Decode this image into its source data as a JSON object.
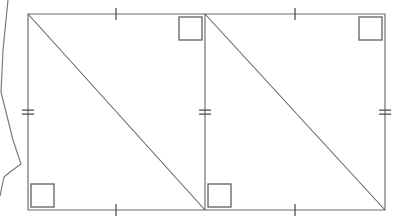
{
  "figure": {
    "type": "geometry-diagram",
    "canvas": {
      "width": 405,
      "height": 221
    },
    "background_color": "#ffffff",
    "stroke_color": "#6b6b6b",
    "marker_color": "#595959",
    "tick_color": "#4a4a4a"
  },
  "outline": {
    "name": "outer-rectangle",
    "left": 28,
    "top": 14,
    "right": 385,
    "bottom": 210,
    "width": 357,
    "height": 196,
    "path": "M 28 14 L 385 14 L 385 210 L 28 210 Z"
  },
  "divider": {
    "name": "middle-vertical-divider",
    "x": 205,
    "y_top": 14,
    "y_bottom": 210,
    "path": "M 205 14 L 205 210"
  },
  "diagonals": [
    {
      "name": "left-diagonal",
      "from": {
        "x": 28,
        "y": 14
      },
      "to": {
        "x": 205,
        "y": 210
      },
      "path": "M 28 14 L 205 210"
    },
    {
      "name": "right-diagonal",
      "from": {
        "x": 205,
        "y": 14
      },
      "to": {
        "x": 385,
        "y": 210
      },
      "path": "M 205 14 L 385 210"
    }
  ],
  "right_angle_markers": [
    {
      "name": "right-angle-bottom-left",
      "x": 31,
      "y": 184,
      "size": 23,
      "corner": "bottom-left"
    },
    {
      "name": "right-angle-top-middle",
      "x": 179,
      "y": 17,
      "size": 23,
      "corner": "top-middle-left-of-divider"
    },
    {
      "name": "right-angle-bottom-middle",
      "x": 208,
      "y": 184,
      "size": 23,
      "corner": "bottom-middle-right-of-divider"
    },
    {
      "name": "right-angle-top-right",
      "x": 359,
      "y": 17,
      "size": 23,
      "corner": "top-right"
    }
  ],
  "single_ticks": [
    {
      "name": "tick-top-left-segment",
      "x": 116,
      "y": 14,
      "orientation": "vertical"
    },
    {
      "name": "tick-top-right-segment",
      "x": 295,
      "y": 14,
      "orientation": "vertical"
    },
    {
      "name": "tick-bottom-left-segment",
      "x": 116,
      "y": 210,
      "orientation": "vertical"
    },
    {
      "name": "tick-bottom-right-segment",
      "x": 295,
      "y": 210,
      "orientation": "vertical"
    }
  ],
  "double_ticks": [
    {
      "name": "double-tick-left-side",
      "x": 28,
      "y": 112,
      "orientation": "horizontal"
    },
    {
      "name": "double-tick-middle-divider",
      "x": 205,
      "y": 112,
      "orientation": "horizontal"
    },
    {
      "name": "double-tick-right-side",
      "x": 385,
      "y": 112,
      "orientation": "horizontal"
    }
  ],
  "tick_style": {
    "single_half_length": 6,
    "double_half_length": 6,
    "double_gap": 4
  },
  "clipped_fragment": {
    "name": "clipped-polygon-fragment-left-edge",
    "description": "partial outline of an adjacent figure cut off by the left image border",
    "path": "M 8 0 L 3 50 L 1 92 L 13 140 L 21 164 L 10 172 L 4 177 L 0 196"
  }
}
